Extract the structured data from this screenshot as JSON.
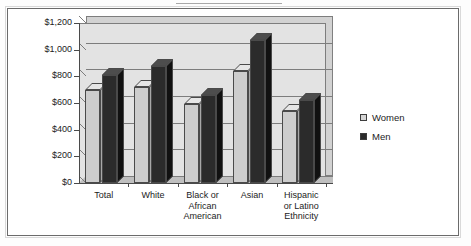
{
  "chart_data": {
    "type": "bar",
    "title": "",
    "xlabel": "",
    "ylabel": "",
    "ylim": [
      0,
      1200
    ],
    "ytick_step": 200,
    "grid": true,
    "legend_position": "right",
    "style": "3d-clustered-column",
    "categories": [
      "Total",
      "Black or\nAfrican\nAmerican",
      "White",
      "Asian",
      "Hispanic\nor Latino\nEthnicity"
    ],
    "category_lines": [
      [
        "Total"
      ],
      [
        "White"
      ],
      [
        "Black or",
        "African",
        "American"
      ],
      [
        "Asian"
      ],
      [
        "Hispanic",
        "or Latino",
        "Ethnicity"
      ]
    ],
    "ytick_labels": [
      "$0",
      "$200",
      "$400",
      "$600",
      "$800",
      "$1,000",
      "$1,200"
    ],
    "ytick_values": [
      0,
      200,
      400,
      600,
      800,
      1000,
      1200
    ],
    "series": [
      {
        "name": "Women",
        "color": "#cdcdcd",
        "values": [
          700,
          720,
          595,
          840,
          540
        ]
      },
      {
        "name": "Men",
        "color": "#2b2b2b",
        "values": [
          810,
          880,
          660,
          1070,
          620
        ]
      }
    ]
  },
  "legend": {
    "items": [
      {
        "label": "Women",
        "swatch": "women"
      },
      {
        "label": "Men",
        "swatch": "men"
      }
    ]
  },
  "colors": {
    "women_bar": "#cdcdcd",
    "men_bar": "#2b2b2b",
    "plot_background": "#e3e3e3",
    "back_wall": "#d2d2d2",
    "gridline": "#7d7d7d",
    "axis": "#4a4a4a",
    "frame": "#6b6b6b",
    "text": "#1c1c1c"
  }
}
